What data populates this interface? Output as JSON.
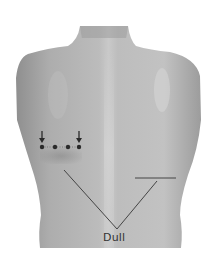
{
  "figure": {
    "annotations": {
      "dull_label": "Dull",
      "arrow_count": 2,
      "dot_count": 4
    },
    "colors": {
      "skin_light": "#c8c8c8",
      "skin_mid": "#a9a9a9",
      "skin_dark": "#8e8e8e",
      "line": "#444444",
      "marker": "#2a2a2a",
      "background": "#ffffff"
    }
  }
}
